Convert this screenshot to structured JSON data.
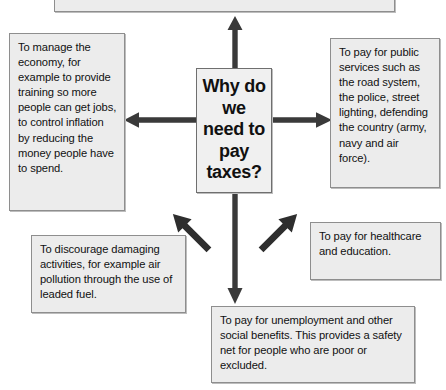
{
  "diagram": {
    "title": "Why do we need to pay taxes?",
    "type": "spider-mind-map",
    "center": {
      "label": "Why do we need to pay taxes?"
    },
    "colors": {
      "box_fill": "#ececec",
      "box_border": "#8e8e8e",
      "arrow": "#333333",
      "text": "#111111",
      "background": "#ffffff"
    },
    "branches": [
      {
        "id": "top",
        "direction": "up",
        "text": ""
      },
      {
        "id": "left",
        "direction": "left",
        "text": "To manage the economy, for example to provide training so more people can get jobs, to control inflation by reducing the money people have to spend."
      },
      {
        "id": "right",
        "direction": "right",
        "text": "To pay for public services such as the road system, the police, street lighting, defending the country (army, navy and air force)."
      },
      {
        "id": "bottom-left",
        "direction": "down-left",
        "text": "To discourage damaging activities, for example air pollution through the use of leaded fuel."
      },
      {
        "id": "bottom-right",
        "direction": "down-right",
        "text": "To pay for healthcare and education."
      },
      {
        "id": "bottom",
        "direction": "down",
        "text": "To pay for unemployment and other social benefits. This provides a safety net for people who are poor or excluded."
      }
    ]
  }
}
